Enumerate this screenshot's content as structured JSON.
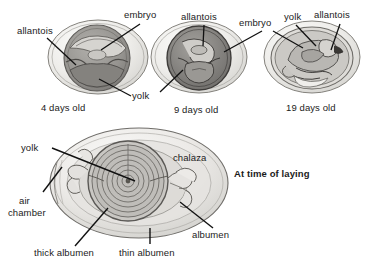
{
  "figure": {
    "title_caption": "At time of laying",
    "background_color": "#ffffff",
    "ink_color": "#1b1b1b",
    "shell_fill": "#efeeec",
    "shell_stroke": "#6e6d6b",
    "yolk_fill": "#9a9894",
    "embryo_fill": "#7e7c79",
    "albumen_fill": "#dcdbd8"
  },
  "stages": [
    {
      "id": "stage-4-days",
      "caption": "4 days old",
      "labels": [
        "allantois",
        "embryo",
        "yolk"
      ]
    },
    {
      "id": "stage-9-days",
      "caption": "9 days old",
      "labels": [
        "allantois",
        "embryo",
        "yolk"
      ]
    },
    {
      "id": "stage-19-days",
      "caption": "19 days old",
      "labels": [
        "embryo",
        "yolk",
        "allantois"
      ]
    }
  ],
  "laying_diagram": {
    "caption": "At time of laying",
    "labels": [
      "yolk",
      "chalaza",
      "air chamber",
      "thick albumen",
      "thin albumen",
      "albumen"
    ]
  },
  "labels": {
    "allantois_1": "allantois",
    "embryo_1": "embryo",
    "yolk_1": "yolk",
    "caption_1": "4 days old",
    "allantois_2": "allantois",
    "embryo_2": "embryo",
    "caption_2": "9 days old",
    "yolk_3": "yolk",
    "allantois_3": "allantois",
    "caption_3": "19 days old",
    "yolk_big": "yolk",
    "chalaza": "chalaza",
    "air_line1": "air",
    "air_line2": "chamber",
    "thick_albumen": "thick albumen",
    "thin_albumen": "thin albumen",
    "albumen": "albumen",
    "at_time_of_laying": "At time of laying"
  }
}
